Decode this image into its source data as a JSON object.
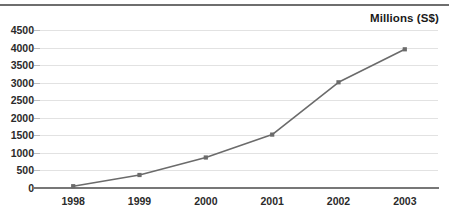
{
  "chart_data": {
    "type": "line",
    "title": "Millions (S$)",
    "xlabel": "",
    "ylabel": "",
    "categories": [
      "1998",
      "1999",
      "2000",
      "2001",
      "2002",
      "2003"
    ],
    "x": [
      1998,
      1999,
      2000,
      2001,
      2002,
      2003
    ],
    "values": [
      50,
      370,
      870,
      1520,
      3010,
      3950
    ],
    "series": [
      {
        "name": "Millions (S$)",
        "values": [
          50,
          370,
          870,
          1520,
          3010,
          3950
        ]
      }
    ],
    "ylim": [
      0,
      4500
    ],
    "yticks": [
      0,
      500,
      1000,
      1500,
      2000,
      2500,
      3000,
      3500,
      4000,
      4500
    ],
    "ytick_labels": [
      "0",
      "500",
      "1000",
      "1500",
      "2000",
      "2500",
      "3000",
      "3500",
      "4000",
      "4500"
    ],
    "xtick_labels": [
      "1998",
      "1999",
      "2000",
      "2001",
      "2002",
      "2003"
    ],
    "grid": true,
    "legend": false,
    "legend_position": "none",
    "marker": "square",
    "colors": {
      "line": "#6b6b6b",
      "marker": "#6b6b6b",
      "grid": "#e2e2e2",
      "axis": "#777777",
      "text": "#2b2b2b",
      "title": "#1a1a1a",
      "rule": "#6e6e6e",
      "background": "#ffffff"
    }
  }
}
